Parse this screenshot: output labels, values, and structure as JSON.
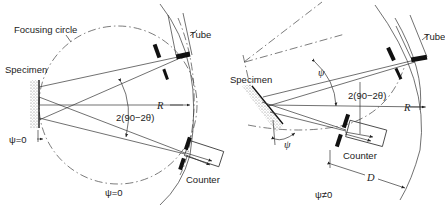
{
  "figure": {
    "left_panel": {
      "labels": {
        "focusing_circle": "Focusing circle",
        "specimen": "Specimen",
        "tube": "Tube",
        "counter": "Counter",
        "radius": "R",
        "angle": "2(90−2θ)",
        "psi_left": "ψ=0",
        "psi_bottom": "ψ=0"
      }
    },
    "right_panel": {
      "labels": {
        "specimen": "Specimen",
        "tube": "Tube",
        "counter": "Counter",
        "radius": "R",
        "angle": "2(90−2θ)",
        "psi_top": "ψ",
        "psi_bottom": "ψ",
        "distance": "D",
        "psi_condition": "ψ≠0"
      }
    },
    "colors": {
      "line": "#333333",
      "specimen_fill": "#bbbbbb",
      "background": "#ffffff"
    }
  }
}
